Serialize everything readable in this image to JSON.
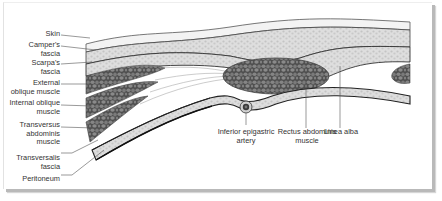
{
  "diagram": {
    "colors": {
      "skin_layer": "#f2f2f2",
      "fat_layer": "#d9d9d9",
      "muscle": "#7d7d7d",
      "muscle_cell_outline": "#4d4d4d",
      "fascia_line": "#3a3a3a",
      "label_text": "#333333",
      "leader_line": "#555555",
      "frame_shadow": "#b9b9b9"
    },
    "left_labels": [
      {
        "id": "skin",
        "text": "Skin"
      },
      {
        "id": "campers-fascia",
        "text": "Camper's\nfascia"
      },
      {
        "id": "scarpas-fascia",
        "text": "Scarpa's\nfascia"
      },
      {
        "id": "external-oblique",
        "text": "External\noblique muscle"
      },
      {
        "id": "internal-oblique",
        "text": "Internal oblique\nmuscle"
      },
      {
        "id": "transversus-abdominis",
        "text": "Transversus\nabdominis\nmuscle"
      },
      {
        "id": "transversalis-fascia",
        "text": "Transversalis\nfascia"
      },
      {
        "id": "peritoneum",
        "text": "Peritoneum"
      }
    ],
    "bottom_labels": [
      {
        "id": "inferior-epigastric-artery",
        "text": "Inferior epigastric\nartery"
      },
      {
        "id": "rectus-abdominis",
        "text": "Rectus abdominis\nmuscle"
      },
      {
        "id": "linea-alba",
        "text": "Linea alba"
      }
    ]
  }
}
